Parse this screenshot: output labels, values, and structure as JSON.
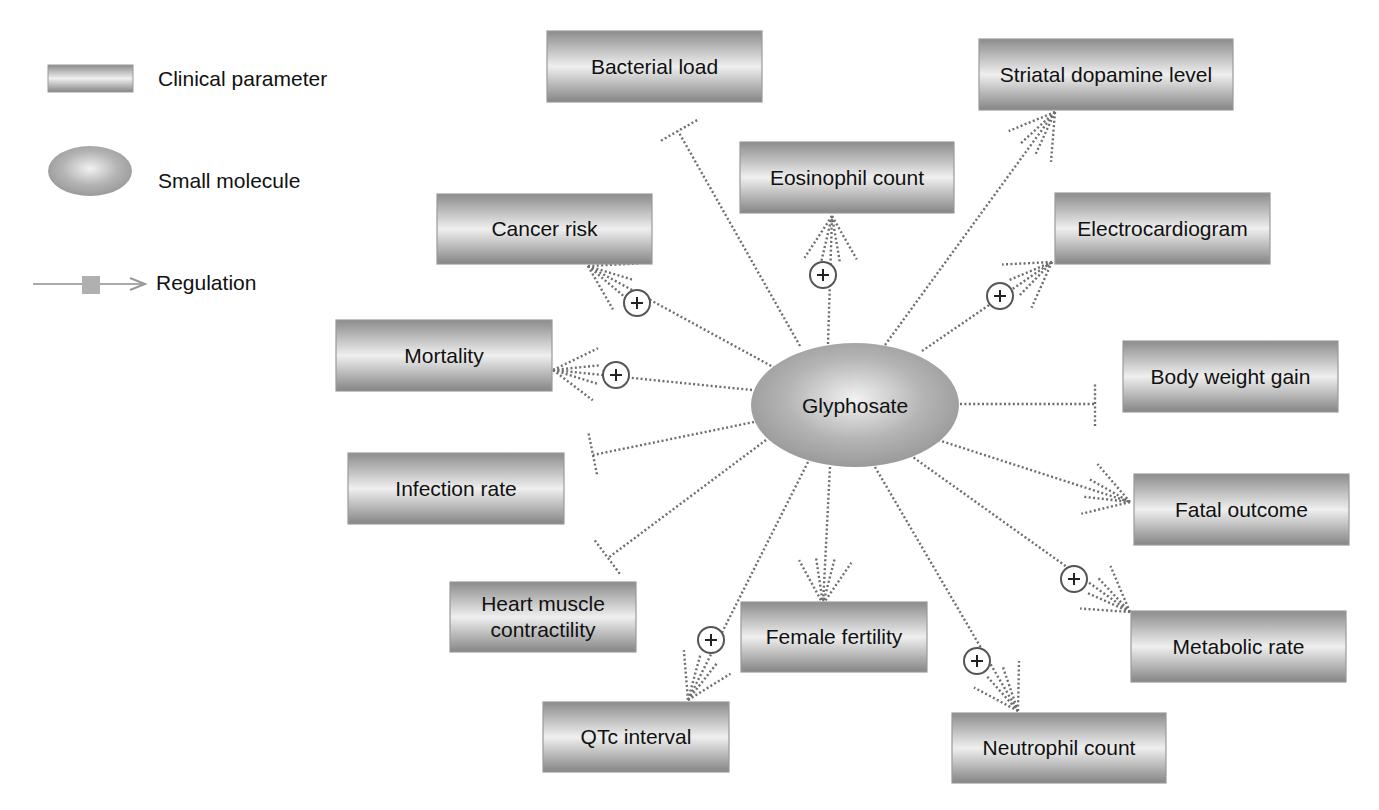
{
  "legend": {
    "items": [
      {
        "key": "clinical_parameter",
        "label": "Clinical parameter",
        "icon": "gradient-rectangle"
      },
      {
        "key": "small_molecule",
        "label": "Small molecule",
        "icon": "gradient-ellipse"
      },
      {
        "key": "regulation",
        "label": "Regulation",
        "icon": "arrow-with-square"
      }
    ]
  },
  "colors": {
    "box_dark": "#8a8a8a",
    "box_light": "#eeeeee",
    "ellipse_center": "#eeeeee",
    "ellipse_edge": "#9a9a9a",
    "edge": "#6e6e6e",
    "text": "#111111"
  },
  "center": {
    "id": "glyphosate",
    "label": "Glyphosate",
    "type": "small_molecule"
  },
  "nodes": [
    {
      "id": "bacterial_load",
      "label": "Bacterial load"
    },
    {
      "id": "striatal_dopamine",
      "label": "Striatal dopamine level"
    },
    {
      "id": "eosinophil_count",
      "label": "Eosinophil count"
    },
    {
      "id": "cancer_risk",
      "label": "Cancer risk"
    },
    {
      "id": "electrocardiogram",
      "label": "Electrocardiogram"
    },
    {
      "id": "mortality",
      "label": "Mortality"
    },
    {
      "id": "body_weight_gain",
      "label": "Body weight gain"
    },
    {
      "id": "infection_rate",
      "label": "Infection rate"
    },
    {
      "id": "fatal_outcome",
      "label": "Fatal outcome"
    },
    {
      "id": "heart_muscle",
      "label": "Heart muscle contractility",
      "lines": [
        "Heart muscle",
        "contractility"
      ]
    },
    {
      "id": "female_fertility",
      "label": "Female fertility"
    },
    {
      "id": "metabolic_rate",
      "label": "Metabolic rate"
    },
    {
      "id": "qtc_interval",
      "label": "QTc interval"
    },
    {
      "id": "neutrophil_count",
      "label": "Neutrophil count"
    }
  ],
  "edges": [
    {
      "target": "bacterial_load",
      "effect": "inhibition",
      "plus": false
    },
    {
      "target": "striatal_dopamine",
      "effect": "activation",
      "plus": false
    },
    {
      "target": "eosinophil_count",
      "effect": "activation",
      "plus": true
    },
    {
      "target": "cancer_risk",
      "effect": "activation",
      "plus": true
    },
    {
      "target": "electrocardiogram",
      "effect": "activation",
      "plus": true
    },
    {
      "target": "mortality",
      "effect": "activation",
      "plus": true
    },
    {
      "target": "body_weight_gain",
      "effect": "inhibition",
      "plus": false
    },
    {
      "target": "infection_rate",
      "effect": "inhibition",
      "plus": false
    },
    {
      "target": "fatal_outcome",
      "effect": "activation",
      "plus": false
    },
    {
      "target": "heart_muscle",
      "effect": "inhibition",
      "plus": false
    },
    {
      "target": "female_fertility",
      "effect": "activation",
      "plus": false
    },
    {
      "target": "metabolic_rate",
      "effect": "activation",
      "plus": true
    },
    {
      "target": "qtc_interval",
      "effect": "activation",
      "plus": true
    },
    {
      "target": "neutrophil_count",
      "effect": "activation",
      "plus": true
    }
  ],
  "plus_symbol": "+"
}
